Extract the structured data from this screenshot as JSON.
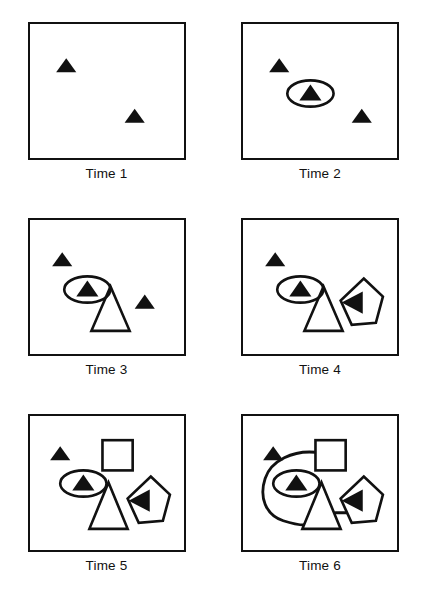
{
  "figure": {
    "kind": "time-sequence-diagram",
    "columns": 2,
    "rows": 3,
    "panel_count": 6,
    "background_color": "#ffffff",
    "ink_color": "#111111"
  },
  "panels": [
    {
      "id": "time-1",
      "label": "Time 1",
      "elements": [
        {
          "name": "filled-triangle-left",
          "type": "filled-triangle",
          "x": 26,
          "y": 36,
          "size": 20,
          "rotation": 0
        },
        {
          "name": "filled-triangle-right",
          "type": "filled-triangle",
          "x": 94,
          "y": 86,
          "size": 20,
          "rotation": 0
        }
      ]
    },
    {
      "id": "time-2",
      "label": "Time 2",
      "elements": [
        {
          "name": "filled-triangle-left",
          "type": "filled-triangle",
          "x": 26,
          "y": 36,
          "size": 20,
          "rotation": 0
        },
        {
          "name": "filled-triangle-center",
          "type": "filled-triangle",
          "x": 56,
          "y": 62,
          "size": 22,
          "rotation": 0
        },
        {
          "name": "ellipse-highlight",
          "type": "ellipse",
          "cx": 67,
          "cy": 69,
          "rx": 23,
          "ry": 13
        },
        {
          "name": "filled-triangle-right",
          "type": "filled-triangle",
          "x": 108,
          "y": 86,
          "size": 20,
          "rotation": 0
        }
      ]
    },
    {
      "id": "time-3",
      "label": "Time 3",
      "elements": [
        {
          "name": "filled-triangle-left",
          "type": "filled-triangle",
          "x": 22,
          "y": 34,
          "size": 20,
          "rotation": 0
        },
        {
          "name": "filled-triangle-center",
          "type": "filled-triangle",
          "x": 46,
          "y": 62,
          "size": 22,
          "rotation": 0
        },
        {
          "name": "ellipse-highlight",
          "type": "ellipse",
          "cx": 57,
          "cy": 69,
          "rx": 23,
          "ry": 13
        },
        {
          "name": "outlined-triangle",
          "type": "outlined-triangle",
          "cx": 80,
          "base_y": 110,
          "width": 38,
          "height": 44
        },
        {
          "name": "filled-triangle-right",
          "type": "filled-triangle",
          "x": 104,
          "y": 76,
          "size": 20,
          "rotation": 0
        }
      ]
    },
    {
      "id": "time-4",
      "label": "Time 4",
      "elements": [
        {
          "name": "filled-triangle-left",
          "type": "filled-triangle",
          "x": 22,
          "y": 34,
          "size": 20,
          "rotation": 0
        },
        {
          "name": "filled-triangle-center",
          "type": "filled-triangle",
          "x": 46,
          "y": 62,
          "size": 22,
          "rotation": 0
        },
        {
          "name": "ellipse-highlight",
          "type": "ellipse",
          "cx": 57,
          "cy": 69,
          "rx": 23,
          "ry": 13
        },
        {
          "name": "outlined-triangle",
          "type": "outlined-triangle",
          "cx": 80,
          "base_y": 110,
          "width": 38,
          "height": 44
        },
        {
          "name": "outlined-pentagon",
          "type": "outlined-pentagon",
          "cx": 117,
          "cy": 82,
          "r": 25
        },
        {
          "name": "filled-triangle-rotated",
          "type": "filled-triangle",
          "x": 98,
          "y": 74,
          "size": 22,
          "rotation": 270
        }
      ]
    },
    {
      "id": "time-5",
      "label": "Time 5",
      "elements": [
        {
          "name": "filled-triangle-left",
          "type": "filled-triangle",
          "x": 20,
          "y": 32,
          "size": 20,
          "rotation": 0
        },
        {
          "name": "outlined-square",
          "type": "outlined-square",
          "x": 72,
          "y": 24,
          "size": 30
        },
        {
          "name": "filled-triangle-center",
          "type": "filled-triangle",
          "x": 42,
          "y": 60,
          "size": 22,
          "rotation": 0
        },
        {
          "name": "ellipse-highlight",
          "type": "ellipse",
          "cx": 53,
          "cy": 67,
          "rx": 23,
          "ry": 13
        },
        {
          "name": "outlined-triangle",
          "type": "outlined-triangle",
          "cx": 78,
          "base_y": 112,
          "width": 38,
          "height": 46
        },
        {
          "name": "outlined-pentagon",
          "type": "outlined-pentagon",
          "cx": 117,
          "cy": 84,
          "r": 25
        },
        {
          "name": "filled-triangle-rotated",
          "type": "filled-triangle",
          "x": 98,
          "y": 76,
          "size": 22,
          "rotation": 270
        }
      ]
    },
    {
      "id": "time-6",
      "label": "Time 6",
      "elements": [
        {
          "name": "filled-triangle-left",
          "type": "filled-triangle",
          "x": 20,
          "y": 32,
          "size": 20,
          "rotation": 0
        },
        {
          "name": "outlined-square",
          "type": "outlined-square",
          "x": 72,
          "y": 24,
          "size": 30
        },
        {
          "name": "filled-triangle-center",
          "type": "filled-triangle",
          "x": 42,
          "y": 60,
          "size": 22,
          "rotation": 0
        },
        {
          "name": "ellipse-highlight",
          "type": "ellipse",
          "cx": 53,
          "cy": 67,
          "rx": 23,
          "ry": 13
        },
        {
          "name": "outlined-triangle",
          "type": "outlined-triangle",
          "cx": 78,
          "base_y": 112,
          "width": 38,
          "height": 46
        },
        {
          "name": "outlined-pentagon",
          "type": "outlined-pentagon",
          "cx": 117,
          "cy": 84,
          "r": 25
        },
        {
          "name": "filled-triangle-rotated",
          "type": "filled-triangle",
          "x": 98,
          "y": 76,
          "size": 22,
          "rotation": 270
        },
        {
          "name": "looping-connector",
          "type": "curve",
          "from": "outlined-square",
          "to": "outlined-triangle",
          "note": "sweeps left around the ellipse"
        },
        {
          "name": "straight-connector",
          "type": "line",
          "from": "outlined-triangle",
          "to": "outlined-pentagon"
        }
      ]
    }
  ]
}
